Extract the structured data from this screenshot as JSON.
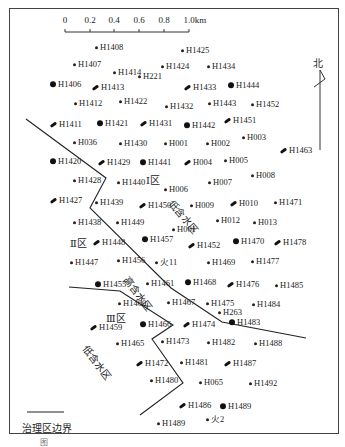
{
  "scale_bar": {
    "ticks": [
      "0",
      "0.2",
      "0.4",
      "0.6",
      "0.8",
      "1.0km"
    ]
  },
  "north_label": "北",
  "zones": {
    "zone1": "Ⅰ区",
    "zone2": "Ⅱ区",
    "zone3": "Ⅲ区",
    "low_water_1": "低含水区",
    "high_water": "高含水区",
    "low_water_2": "低含水区"
  },
  "legend": {
    "boundary_label": "治理区边界"
  },
  "caption": "图",
  "wells": [
    {
      "id": "H1408",
      "type": "oil",
      "x": 95,
      "y": 47
    },
    {
      "id": "H1425",
      "type": "oil",
      "x": 181,
      "y": 50
    },
    {
      "id": "H1407",
      "type": "oil",
      "x": 73,
      "y": 64
    },
    {
      "id": "H1424",
      "type": "oil",
      "x": 161,
      "y": 66
    },
    {
      "id": "H1434",
      "type": "oil",
      "x": 207,
      "y": 66
    },
    {
      "id": "H1414",
      "type": "oil",
      "x": 113,
      "y": 72
    },
    {
      "id": "H221",
      "type": "oil",
      "x": 138,
      "y": 76
    },
    {
      "id": "H1406",
      "type": "major",
      "x": 50,
      "y": 84
    },
    {
      "id": "H1413",
      "type": "injector",
      "x": 92,
      "y": 87
    },
    {
      "id": "H1433",
      "type": "injector",
      "x": 184,
      "y": 87
    },
    {
      "id": "H1444",
      "type": "major",
      "x": 228,
      "y": 85
    },
    {
      "id": "H1412",
      "type": "oil",
      "x": 74,
      "y": 103
    },
    {
      "id": "H1422",
      "type": "oil",
      "x": 119,
      "y": 101
    },
    {
      "id": "H1432",
      "type": "oil",
      "x": 165,
      "y": 106
    },
    {
      "id": "H1443",
      "type": "oil",
      "x": 208,
      "y": 103
    },
    {
      "id": "H1452",
      "type": "oil",
      "x": 251,
      "y": 104
    },
    {
      "id": "H1411",
      "type": "injector",
      "x": 50,
      "y": 124
    },
    {
      "id": "H1421",
      "type": "major",
      "x": 97,
      "y": 123
    },
    {
      "id": "H1431",
      "type": "injector",
      "x": 140,
      "y": 123
    },
    {
      "id": "H1442",
      "type": "major",
      "x": 184,
      "y": 125
    },
    {
      "id": "H1451",
      "type": "injector",
      "x": 224,
      "y": 120
    },
    {
      "id": "H003",
      "type": "oil",
      "x": 242,
      "y": 137
    },
    {
      "id": "H036",
      "type": "oil",
      "x": 73,
      "y": 142
    },
    {
      "id": "H1430",
      "type": "oil",
      "x": 119,
      "y": 143
    },
    {
      "id": "H001",
      "type": "oil",
      "x": 164,
      "y": 143
    },
    {
      "id": "H002",
      "type": "oil",
      "x": 206,
      "y": 143
    },
    {
      "id": "H1463",
      "type": "injector",
      "x": 280,
      "y": 150
    },
    {
      "id": "H1420",
      "type": "major",
      "x": 50,
      "y": 161
    },
    {
      "id": "H1429",
      "type": "injector",
      "x": 98,
      "y": 162
    },
    {
      "id": "H1441",
      "type": "major",
      "x": 140,
      "y": 162
    },
    {
      "id": "H004",
      "type": "injector",
      "x": 184,
      "y": 162
    },
    {
      "id": "H005",
      "type": "oil",
      "x": 224,
      "y": 160
    },
    {
      "id": "H1428",
      "type": "oil",
      "x": 73,
      "y": 180
    },
    {
      "id": "H1440",
      "type": "oil",
      "x": 117,
      "y": 182
    },
    {
      "id": "H007",
      "type": "oil",
      "x": 208,
      "y": 182
    },
    {
      "id": "H008",
      "type": "oil",
      "x": 251,
      "y": 175
    },
    {
      "id": "H006",
      "type": "oil",
      "x": 164,
      "y": 189
    },
    {
      "id": "H1427",
      "type": "injector",
      "x": 50,
      "y": 200
    },
    {
      "id": "H1439",
      "type": "oil",
      "x": 95,
      "y": 202
    },
    {
      "id": "H1450",
      "type": "injector",
      "x": 139,
      "y": 205
    },
    {
      "id": "H009",
      "type": "oil",
      "x": 190,
      "y": 205
    },
    {
      "id": "H010",
      "type": "injector",
      "x": 230,
      "y": 203
    },
    {
      "id": "H1471",
      "type": "oil",
      "x": 274,
      "y": 202
    },
    {
      "id": "H1438",
      "type": "oil",
      "x": 73,
      "y": 222
    },
    {
      "id": "H1449",
      "type": "oil",
      "x": 116,
      "y": 222
    },
    {
      "id": "H012",
      "type": "oil",
      "x": 216,
      "y": 220
    },
    {
      "id": "H013",
      "type": "oil",
      "x": 253,
      "y": 222
    },
    {
      "id": "H001b",
      "label": "H001",
      "type": "oil",
      "x": 172,
      "y": 229
    },
    {
      "id": "H1448",
      "type": "injector",
      "x": 93,
      "y": 242
    },
    {
      "id": "H1457",
      "type": "major",
      "x": 142,
      "y": 239
    },
    {
      "id": "H1452b",
      "label": "H1452",
      "type": "injector",
      "x": 188,
      "y": 245
    },
    {
      "id": "H1470",
      "type": "major",
      "x": 233,
      "y": 241
    },
    {
      "id": "H1478",
      "type": "injector",
      "x": 274,
      "y": 242
    },
    {
      "id": "H1447",
      "type": "oil",
      "x": 70,
      "y": 262
    },
    {
      "id": "H1456",
      "type": "oil",
      "x": 117,
      "y": 260
    },
    {
      "id": "火11",
      "type": "oil",
      "x": 155,
      "y": 262
    },
    {
      "id": "H1469",
      "type": "oil",
      "x": 207,
      "y": 262
    },
    {
      "id": "H1477",
      "type": "oil",
      "x": 251,
      "y": 261
    },
    {
      "id": "H1455",
      "type": "major",
      "x": 95,
      "y": 284
    },
    {
      "id": "H1461",
      "type": "oil",
      "x": 146,
      "y": 283
    },
    {
      "id": "H1468",
      "type": "major",
      "x": 185,
      "y": 282
    },
    {
      "id": "H1476",
      "type": "injector",
      "x": 227,
      "y": 284
    },
    {
      "id": "H1485",
      "type": "oil",
      "x": 275,
      "y": 285
    },
    {
      "id": "H1460",
      "type": "oil",
      "x": 118,
      "y": 303
    },
    {
      "id": "H1467",
      "type": "oil",
      "x": 167,
      "y": 302
    },
    {
      "id": "H1475",
      "type": "oil",
      "x": 206,
      "y": 303
    },
    {
      "id": "H1484",
      "type": "oil",
      "x": 252,
      "y": 304
    },
    {
      "id": "H263",
      "type": "oil",
      "x": 218,
      "y": 312
    },
    {
      "id": "H1483",
      "type": "major",
      "x": 229,
      "y": 322
    },
    {
      "id": "H1459",
      "type": "injector",
      "x": 90,
      "y": 327
    },
    {
      "id": "H1466",
      "type": "major",
      "x": 140,
      "y": 324
    },
    {
      "id": "H1474",
      "type": "injector",
      "x": 183,
      "y": 324
    },
    {
      "id": "H1465",
      "type": "oil",
      "x": 116,
      "y": 343
    },
    {
      "id": "H1473",
      "type": "oil",
      "x": 161,
      "y": 341
    },
    {
      "id": "H1482",
      "type": "oil",
      "x": 207,
      "y": 342
    },
    {
      "id": "H1488",
      "type": "oil",
      "x": 254,
      "y": 343
    },
    {
      "id": "H1472",
      "type": "injector",
      "x": 136,
      "y": 363
    },
    {
      "id": "H1481",
      "type": "oil",
      "x": 180,
      "y": 362
    },
    {
      "id": "H1487",
      "type": "injector",
      "x": 224,
      "y": 363
    },
    {
      "id": "H1480",
      "type": "oil",
      "x": 150,
      "y": 380
    },
    {
      "id": "H065",
      "type": "oil",
      "x": 199,
      "y": 382
    },
    {
      "id": "H1492",
      "type": "oil",
      "x": 249,
      "y": 383
    },
    {
      "id": "H1486",
      "type": "injector",
      "x": 179,
      "y": 405
    },
    {
      "id": "H1489",
      "type": "major",
      "x": 220,
      "y": 406
    },
    {
      "id": "火2",
      "type": "oil",
      "x": 206,
      "y": 419
    },
    {
      "id": "H1489b",
      "label": "H1489",
      "type": "oil",
      "x": 157,
      "y": 423
    }
  ]
}
